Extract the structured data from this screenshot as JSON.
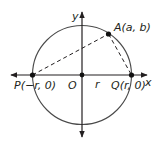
{
  "diagram": {
    "type": "geometry-circle",
    "colors": {
      "stroke": "#3a3a3a",
      "ink": "#231f20",
      "background": "#ffffff"
    },
    "axes": {
      "x_label": "x",
      "y_label": "y"
    },
    "origin": {
      "label": "O"
    },
    "radius_label": "r",
    "points": {
      "A": {
        "label": "A(a, b)"
      },
      "P": {
        "label": "P(−r, 0)"
      },
      "Q": {
        "label": "Q(r, 0)"
      }
    },
    "segments": [
      {
        "from": "P",
        "to": "A",
        "style": "dashed"
      },
      {
        "from": "A",
        "to": "Q",
        "style": "dashed"
      }
    ]
  }
}
